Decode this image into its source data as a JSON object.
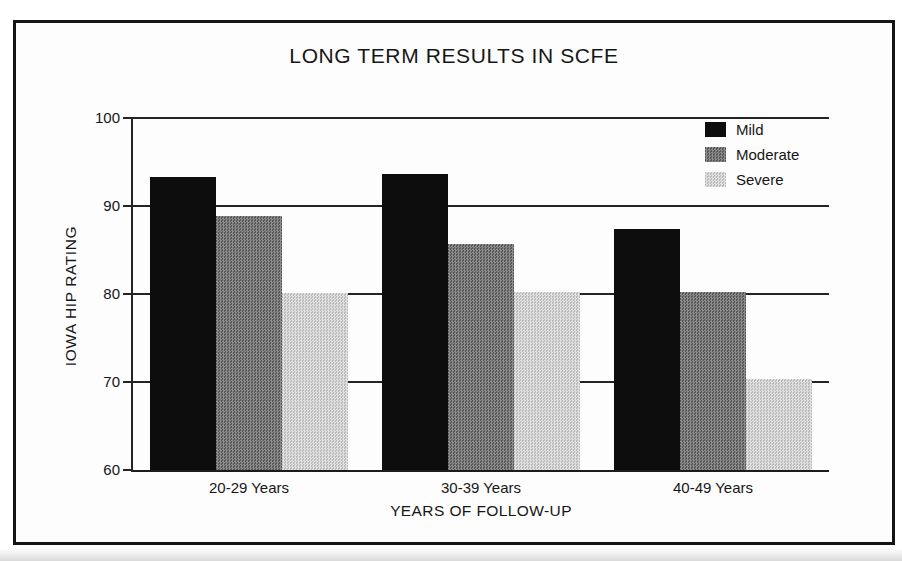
{
  "title": "LONG TERM RESULTS IN SCFE",
  "chart_data": {
    "type": "bar",
    "title": "LONG TERM RESULTS IN SCFE",
    "xlabel": "YEARS OF FOLLOW-UP",
    "ylabel": "IOWA HIP RATING",
    "categories": [
      "20-29 Years",
      "30-39 Years",
      "40-49 Years"
    ],
    "series": [
      {
        "name": "Mild",
        "color": "#0d0d0d",
        "values": [
          93.3,
          93.6,
          87.4
        ]
      },
      {
        "name": "Moderate",
        "color": "#646464",
        "values": [
          88.9,
          85.7,
          80.2
        ]
      },
      {
        "name": "Severe",
        "color": "#d5d5d5",
        "values": [
          80.1,
          80.2,
          70.3
        ]
      }
    ],
    "ylim": [
      60,
      100
    ],
    "yticks": [
      60,
      70,
      80,
      90,
      100
    ],
    "grid": true,
    "legend_position": "top-right"
  }
}
